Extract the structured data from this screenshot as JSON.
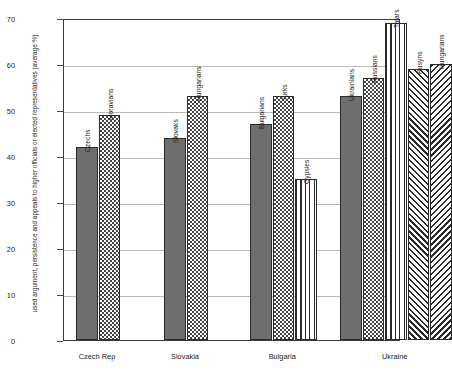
{
  "chart_data": {
    "type": "bar",
    "title": "",
    "xlabel": "",
    "ylabel": "used argument, persistence and appeals to higher officials or elected representatives (average %)",
    "ylim": [
      0,
      70
    ],
    "yticks": [
      0,
      10,
      20,
      30,
      40,
      50,
      60,
      70
    ],
    "grid": true,
    "legend": "none",
    "categories": [
      "Czech Rep",
      "Slovakia",
      "Bulgaria",
      "Ukraine"
    ],
    "groups": [
      {
        "category": "Czech Rep",
        "bars": [
          {
            "label": "Czechs",
            "value": 42,
            "pattern": "solid-gray"
          },
          {
            "label": "Moravians",
            "value": 49,
            "pattern": "checkerboard"
          }
        ]
      },
      {
        "category": "Slovakia",
        "bars": [
          {
            "label": "Slovaks",
            "value": 44,
            "pattern": "solid-gray"
          },
          {
            "label": "Hungarians",
            "value": 53,
            "pattern": "checkerboard"
          }
        ]
      },
      {
        "category": "Bulgaria",
        "bars": [
          {
            "label": "Bulgarians",
            "value": 47,
            "pattern": "solid-gray"
          },
          {
            "label": "Turks",
            "value": 53,
            "pattern": "checkerboard"
          },
          {
            "label": "Gypsies",
            "value": 35,
            "pattern": "vertical-stripes"
          }
        ]
      },
      {
        "category": "Ukraine",
        "bars": [
          {
            "label": "Ukrainians",
            "value": 53,
            "pattern": "solid-gray"
          },
          {
            "label": "Russians",
            "value": 57,
            "pattern": "checkerboard"
          },
          {
            "label": "Tatars",
            "value": 69,
            "pattern": "vertical-stripes"
          },
          {
            "label": "Rusyns",
            "value": 59,
            "pattern": "diagonal-hatch-left"
          },
          {
            "label": "Hungarians",
            "value": 60,
            "pattern": "diagonal-hatch-right"
          }
        ]
      }
    ],
    "colors": {
      "solid_bar": "#6e6e6e",
      "outline": "#2b2b2b",
      "gridline": "#b9b9b9",
      "axis": "#3a3a3a",
      "text": "#1a1a1a"
    }
  }
}
